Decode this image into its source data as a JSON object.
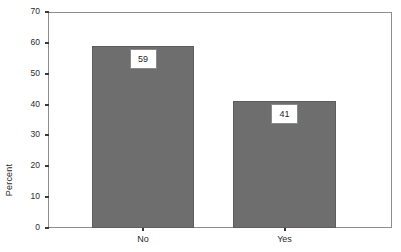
{
  "chart_data": {
    "type": "bar",
    "title": "",
    "subtitle": "",
    "xlabel": "",
    "ylabel": "Percent",
    "categories": [
      "No",
      "Yes"
    ],
    "values": [
      59,
      41
    ],
    "data_labels": [
      "59",
      "41"
    ],
    "ylim": [
      0,
      70
    ],
    "ytick_values": [
      70,
      60,
      50,
      40,
      30,
      20,
      10,
      0
    ],
    "ytick_labels": [
      "70",
      "60",
      "50",
      "40",
      "30",
      "20",
      "10",
      "0"
    ],
    "grid": false,
    "legend": false,
    "legend_position": "none",
    "series": [
      {
        "name": "Percent",
        "values": [
          59,
          41
        ]
      }
    ],
    "colors": {
      "bar_fill": "#6e6e6e",
      "bar_stroke": "#5d5d5d",
      "frame": "#8c8c8c",
      "text": "#2b2b2b",
      "label_box_fill": "#ffffff",
      "label_box_stroke": "#8a8a8a",
      "background": "#ffffff"
    }
  }
}
